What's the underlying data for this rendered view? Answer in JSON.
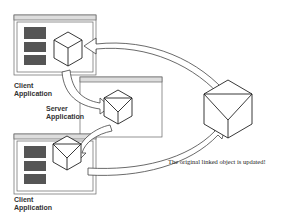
{
  "diagram": {
    "labels": {
      "client_top": [
        "Client",
        "Application"
      ],
      "server": [
        "Server",
        "Application"
      ],
      "client_bottom": [
        "Client",
        "Application"
      ]
    },
    "caption": "The original linked object is updated!"
  }
}
